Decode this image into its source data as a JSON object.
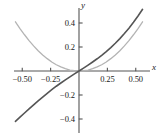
{
  "chart_data": {
    "type": "line",
    "title": "",
    "xlabel": "x",
    "ylabel": "y",
    "xlim": [
      -0.6,
      0.62
    ],
    "ylim": [
      -0.47,
      0.5
    ],
    "grid": false,
    "legend": "none",
    "xticks": [
      -0.5,
      -0.25,
      0.25,
      0.5
    ],
    "xticklabels": [
      "-0.50",
      "-0.25",
      "0.25",
      "0.50"
    ],
    "yticks": [
      0.4,
      0.2,
      -0.2,
      -0.4
    ],
    "yticklabels": [
      "0.4",
      "0.2",
      "-0.2",
      "-0.4"
    ],
    "series": [
      {
        "name": "light-gray-parabola",
        "color": "#b4b4b4",
        "width": 1.3,
        "x": [
          -0.56,
          -0.52,
          -0.48,
          -0.44,
          -0.4,
          -0.36,
          -0.32,
          -0.28,
          -0.24,
          -0.2,
          -0.16,
          -0.12,
          -0.08,
          -0.04,
          0.0,
          0.04,
          0.08,
          0.12,
          0.16,
          0.2,
          0.24,
          0.28,
          0.32,
          0.36,
          0.4,
          0.44,
          0.48,
          0.52,
          0.56
        ],
        "y": [
          0.41,
          0.354,
          0.302,
          0.253,
          0.209,
          0.169,
          0.134,
          0.103,
          0.075,
          0.052,
          0.034,
          0.019,
          0.008,
          0.002,
          0.0,
          0.002,
          0.008,
          0.019,
          0.034,
          0.052,
          0.075,
          0.103,
          0.134,
          0.169,
          0.209,
          0.253,
          0.302,
          0.354,
          0.41
        ]
      },
      {
        "name": "dark-gray-odd-curve",
        "color": "#555555",
        "width": 1.6,
        "x": [
          -0.56,
          -0.52,
          -0.48,
          -0.44,
          -0.4,
          -0.36,
          -0.32,
          -0.28,
          -0.24,
          -0.2,
          -0.16,
          -0.12,
          -0.08,
          -0.04,
          0.0,
          0.04,
          0.08,
          0.12,
          0.16,
          0.2,
          0.24,
          0.28,
          0.32,
          0.36,
          0.4,
          0.44,
          0.48,
          0.52,
          0.56
        ],
        "y": [
          -0.42,
          -0.385,
          -0.35,
          -0.316,
          -0.282,
          -0.249,
          -0.217,
          -0.186,
          -0.156,
          -0.127,
          -0.1,
          -0.074,
          -0.049,
          -0.024,
          0.0,
          0.024,
          0.049,
          0.075,
          0.102,
          0.131,
          0.162,
          0.195,
          0.231,
          0.27,
          0.312,
          0.357,
          0.406,
          0.458,
          0.514
        ]
      }
    ]
  },
  "axes": {
    "x_axis_name": "x",
    "y_axis_name": "y"
  }
}
